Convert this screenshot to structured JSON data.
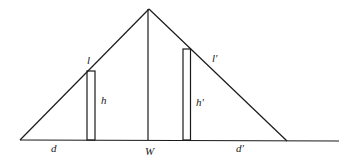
{
  "diagram": {
    "labels": {
      "l": "l",
      "h": "h",
      "l_prime": "l'",
      "h_prime": "h'",
      "d": "d",
      "W": "W",
      "d_prime": "d'"
    }
  }
}
